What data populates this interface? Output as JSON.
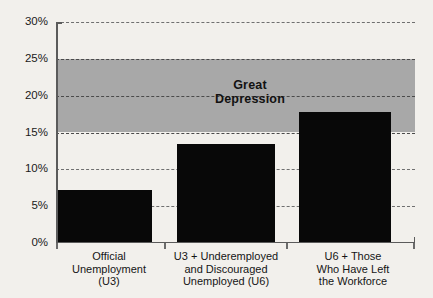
{
  "chart_data": {
    "type": "bar",
    "title": "",
    "xlabel": "",
    "ylabel": "",
    "categories": [
      "Official Unemployment (U3)",
      "U3 + Underemployed and Discouraged Unemployed (U6)",
      "U6 + Those Who Have Left the Workforce"
    ],
    "category_lines": [
      [
        "Official",
        "Unemployment",
        "(U3)"
      ],
      [
        "U3 + Underemployed",
        "and Discouraged",
        "Unemployed (U6)"
      ],
      [
        "U6 + Those",
        "Who Have Left",
        "the Workforce"
      ]
    ],
    "values": [
      7.2,
      13.5,
      17.8
    ],
    "ylim": [
      0,
      30
    ],
    "ytick_values": [
      0,
      5,
      10,
      15,
      20,
      25,
      30
    ],
    "ytick_labels": [
      "0%",
      "5%",
      "10%",
      "15%",
      "20%",
      "25%",
      "30%"
    ],
    "grid": true,
    "legend": "none",
    "annotations": [
      {
        "name": "great-depression-band",
        "label_lines": [
          "Great",
          "Depression"
        ],
        "label": "Great Depression",
        "y_from": 15,
        "y_to": 25,
        "color": "#a8a8a8"
      }
    ],
    "colors": {
      "bar": "#080808",
      "band": "#a8a8a8",
      "grid": "#6f6f6f",
      "axis": "#5b5b5b",
      "background": "#f2f0ec",
      "text": "#151515"
    }
  }
}
